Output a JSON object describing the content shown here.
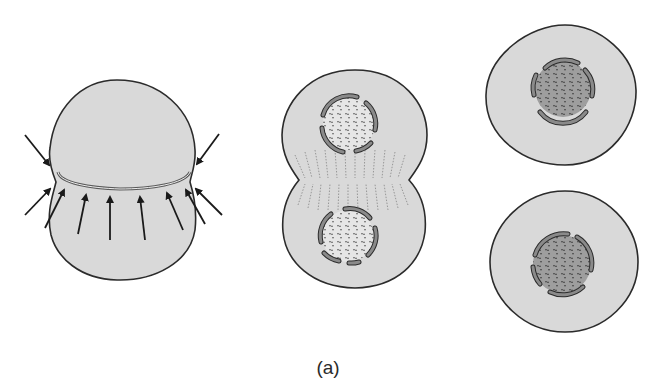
{
  "figure": {
    "caption": "(a)",
    "colors": {
      "background": "#ffffff",
      "cytoplasm": "#d9d9d9",
      "outline": "#2b2b2b",
      "nuclear_envelope": "#7a7a7a",
      "chromatin_light": "#e4e4e4",
      "chromatin_dark": "#9a9a9a",
      "arrow": "#1a1a1a"
    },
    "panels": [
      {
        "id": "stage-1",
        "label": "dividing-cell-with-contractile-ring",
        "arrows": 9
      },
      {
        "id": "stage-2",
        "label": "cleavage-furrow-two-nuclei"
      },
      {
        "id": "stage-3",
        "label": "two-daughter-cells"
      }
    ]
  }
}
